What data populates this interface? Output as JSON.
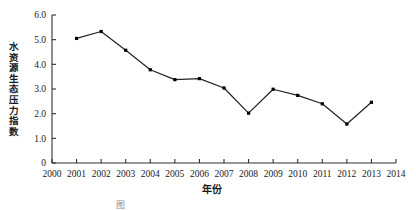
{
  "chart_data": {
    "type": "line",
    "title": "",
    "xlabel": "年份",
    "ylabel": "水资源生态压力指数",
    "xlim": [
      2000,
      2014
    ],
    "ylim": [
      0,
      6.0
    ],
    "grid": false,
    "legend": null,
    "x_ticks": [
      "2000",
      "2001",
      "2002",
      "2003",
      "2004",
      "2005",
      "2006",
      "2007",
      "2008",
      "2009",
      "2010",
      "2011",
      "2012",
      "2013",
      "2014"
    ],
    "y_ticks": [
      "0",
      "1.0",
      "2.0",
      "3.0",
      "4.0",
      "5.0",
      "6.0"
    ],
    "y_tick_values": [
      0,
      1.0,
      2.0,
      3.0,
      4.0,
      5.0,
      6.0
    ],
    "marker": "square",
    "marker_color": "#000000",
    "line_color": "#222222",
    "x": [
      2001,
      2002,
      2003,
      2004,
      2005,
      2006,
      2007,
      2008,
      2009,
      2010,
      2011,
      2012,
      2013
    ],
    "values": [
      5.05,
      5.33,
      4.57,
      3.78,
      3.38,
      3.42,
      3.04,
      2.02,
      2.99,
      2.74,
      2.4,
      1.58,
      2.46
    ],
    "series": [
      {
        "name": "水资源生态压力指数",
        "values": [
          5.05,
          5.33,
          4.57,
          3.78,
          3.38,
          3.42,
          3.04,
          2.02,
          2.99,
          2.74,
          2.4,
          1.58,
          2.46
        ]
      }
    ]
  },
  "figure": {
    "caption": "图"
  }
}
